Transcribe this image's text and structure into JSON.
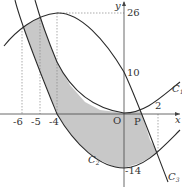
{
  "diagram": {
    "axes": {
      "x_label": "x",
      "y_label": "y",
      "origin_label": "O"
    },
    "x_ticks": [
      "-6",
      "-5",
      "-4",
      "2"
    ],
    "y_ticks": [
      "26",
      "10",
      "-14"
    ],
    "point_label": "P",
    "curves": [
      {
        "name": "C",
        "sub": "1"
      },
      {
        "name": "C",
        "sub": "2"
      },
      {
        "name": "C",
        "sub": "3"
      }
    ],
    "colors": {
      "line": "#2a2a2a",
      "shade": "#c8c8c8",
      "guide": "#888888"
    }
  }
}
